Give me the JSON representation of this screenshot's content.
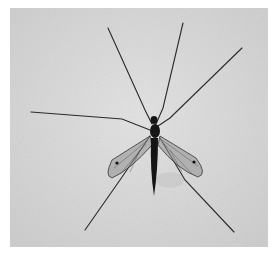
{
  "image": {
    "subject": "crane fly",
    "description": "Grayscale photograph of a crane fly with long thin legs spread, viewed from above on a light textured background",
    "colors": {
      "background": "#ffffff",
      "photo_background": "#d9d9d9",
      "insect": "#1a1a1a",
      "wing": "#8a8a8a"
    }
  }
}
